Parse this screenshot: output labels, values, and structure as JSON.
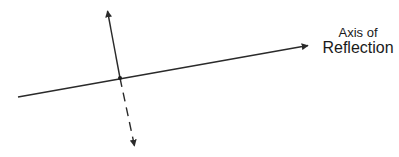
{
  "diagram": {
    "label": {
      "line1": "Axis of",
      "line2": "Reflection"
    },
    "colors": {
      "stroke": "#2a2a2a",
      "background": "#ffffff"
    },
    "axis_line": {
      "start": [
        18,
        97
      ],
      "end": [
        310,
        45
      ],
      "arrow_at_end": true
    },
    "perpendicular": {
      "top_tip": [
        107,
        9
      ],
      "intersection": [
        120,
        78
      ],
      "bottom_tip": [
        135,
        148
      ],
      "solid_segment": "top_to_intersection",
      "dashed_segment": "intersection_to_bottom"
    }
  }
}
